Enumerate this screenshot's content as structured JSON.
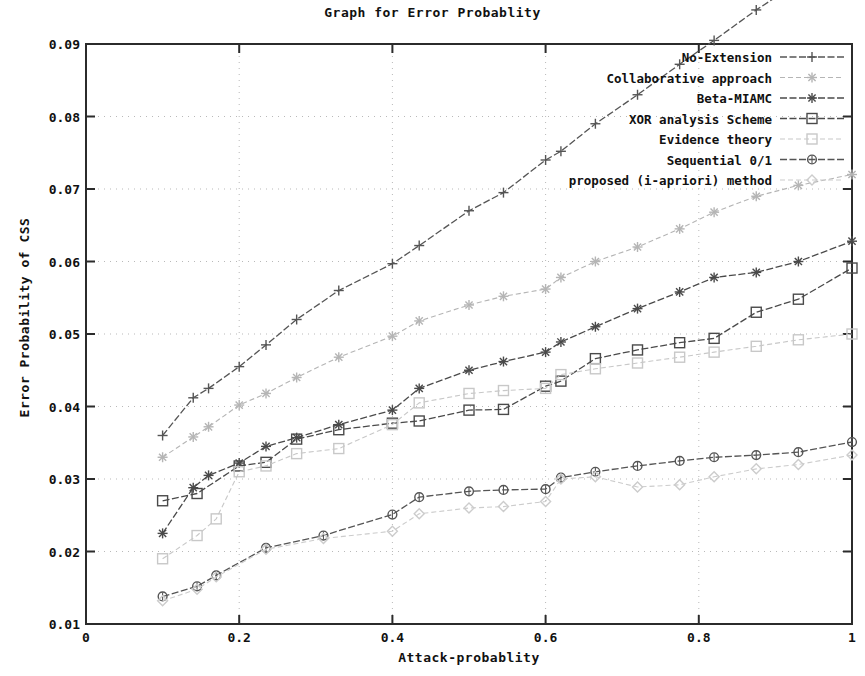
{
  "chart_data": {
    "type": "line",
    "title": "Graph for Error Probablity",
    "xlabel": "Attack-probablity",
    "ylabel": "Error Probability of CSS",
    "xlim": [
      0,
      1
    ],
    "ylim": [
      0.01,
      0.09
    ],
    "xticks": [
      "0",
      "0.2",
      "0.4",
      "0.6",
      "0.8",
      "1"
    ],
    "xtick_values": [
      0,
      0.2,
      0.4,
      0.6,
      0.8,
      1
    ],
    "yticks": [
      "0.01",
      "0.02",
      "0.03",
      "0.04",
      "0.05",
      "0.06",
      "0.07",
      "0.08",
      "0.09"
    ],
    "ytick_values": [
      0.01,
      0.02,
      0.03,
      0.04,
      0.05,
      0.06,
      0.07,
      0.08,
      0.09
    ],
    "grid": true,
    "grid_style": "dotted",
    "legend_position": "top-right",
    "series": [
      {
        "name": "No-Extension",
        "marker": "plus",
        "color": "#555555",
        "x": [
          0.1,
          0.14,
          0.16,
          0.2,
          0.235,
          0.275,
          0.33,
          0.4,
          0.435,
          0.5,
          0.545,
          0.6,
          0.62,
          0.665,
          0.72,
          0.775,
          0.82,
          0.875,
          0.93,
          1.0
        ],
        "values": [
          0.036,
          0.0412,
          0.0425,
          0.0455,
          0.0485,
          0.052,
          0.056,
          0.0597,
          0.0622,
          0.067,
          0.0695,
          0.074,
          0.0752,
          0.079,
          0.083,
          0.0872,
          0.0905,
          0.0947,
          0.0985,
          0.104
        ]
      },
      {
        "name": "Collaborative approach",
        "marker": "star-faint",
        "color": "#b5b5b5",
        "x": [
          0.1,
          0.14,
          0.16,
          0.2,
          0.235,
          0.275,
          0.33,
          0.4,
          0.435,
          0.5,
          0.545,
          0.6,
          0.62,
          0.665,
          0.72,
          0.775,
          0.82,
          0.875,
          0.93,
          1.0
        ],
        "values": [
          0.033,
          0.0358,
          0.0372,
          0.0402,
          0.0418,
          0.044,
          0.0468,
          0.0497,
          0.0518,
          0.054,
          0.0552,
          0.0562,
          0.0578,
          0.06,
          0.062,
          0.0645,
          0.0668,
          0.069,
          0.0705,
          0.072
        ]
      },
      {
        "name": "Beta-MIAMC",
        "marker": "asterisk",
        "color": "#4a4a4a",
        "x": [
          0.1,
          0.14,
          0.16,
          0.2,
          0.235,
          0.275,
          0.33,
          0.4,
          0.435,
          0.5,
          0.545,
          0.6,
          0.62,
          0.665,
          0.72,
          0.775,
          0.82,
          0.875,
          0.93,
          1.0
        ],
        "values": [
          0.0225,
          0.0288,
          0.0305,
          0.0322,
          0.0345,
          0.0357,
          0.0375,
          0.0395,
          0.0425,
          0.045,
          0.0462,
          0.0475,
          0.0489,
          0.051,
          0.0535,
          0.0558,
          0.0578,
          0.0585,
          0.06,
          0.0628
        ]
      },
      {
        "name": "XOR analysis Scheme",
        "marker": "square",
        "color": "#4a4a4a",
        "x": [
          0.1,
          0.145,
          0.2,
          0.235,
          0.275,
          0.33,
          0.4,
          0.435,
          0.5,
          0.545,
          0.6,
          0.62,
          0.665,
          0.72,
          0.775,
          0.82,
          0.875,
          0.93,
          1.0
        ],
        "values": [
          0.027,
          0.028,
          0.0318,
          0.0323,
          0.0355,
          0.0368,
          0.0377,
          0.038,
          0.0395,
          0.0396,
          0.0428,
          0.0435,
          0.0466,
          0.0478,
          0.0488,
          0.0494,
          0.053,
          0.0548,
          0.0591
        ]
      },
      {
        "name": "Evidence theory",
        "marker": "square-faint",
        "color": "#c8c8c8",
        "x": [
          0.1,
          0.145,
          0.17,
          0.2,
          0.235,
          0.275,
          0.33,
          0.4,
          0.435,
          0.5,
          0.545,
          0.6,
          0.62,
          0.665,
          0.72,
          0.775,
          0.82,
          0.875,
          0.93,
          1.0
        ],
        "values": [
          0.019,
          0.0222,
          0.0245,
          0.031,
          0.0318,
          0.0335,
          0.0342,
          0.0375,
          0.0405,
          0.0418,
          0.0422,
          0.0425,
          0.0444,
          0.0452,
          0.046,
          0.0468,
          0.0475,
          0.0483,
          0.0492,
          0.05
        ]
      },
      {
        "name": "Sequential 0/1",
        "marker": "circle",
        "color": "#555555",
        "x": [
          0.1,
          0.145,
          0.17,
          0.235,
          0.31,
          0.4,
          0.435,
          0.5,
          0.545,
          0.6,
          0.62,
          0.665,
          0.72,
          0.775,
          0.82,
          0.875,
          0.93,
          1.0
        ],
        "values": [
          0.0138,
          0.0152,
          0.0167,
          0.0205,
          0.0222,
          0.0251,
          0.0275,
          0.0283,
          0.0285,
          0.0286,
          0.0302,
          0.031,
          0.0318,
          0.0325,
          0.033,
          0.0333,
          0.0337,
          0.0351
        ]
      },
      {
        "name": "proposed (i-apriori) method",
        "marker": "diamond-faint",
        "color": "#cccccc",
        "x": [
          0.1,
          0.145,
          0.17,
          0.235,
          0.31,
          0.4,
          0.435,
          0.5,
          0.545,
          0.6,
          0.62,
          0.665,
          0.72,
          0.775,
          0.82,
          0.875,
          0.93,
          1.0
        ],
        "values": [
          0.0132,
          0.0148,
          0.0165,
          0.0203,
          0.0218,
          0.0228,
          0.0252,
          0.026,
          0.0262,
          0.0269,
          0.03,
          0.0303,
          0.0289,
          0.0292,
          0.0303,
          0.0314,
          0.032,
          0.0333
        ]
      }
    ]
  }
}
